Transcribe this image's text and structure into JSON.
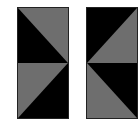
{
  "figure": {
    "panels": [
      {
        "name": "left-panel",
        "x": 17,
        "y": 7,
        "w": 52,
        "h": 112,
        "top_half": {
          "dark_triangle": "lower-left",
          "light_triangle": "upper-right"
        },
        "bottom_half": {
          "dark_triangle": "lower-right",
          "light_triangle": "upper-left"
        }
      },
      {
        "name": "right-panel",
        "x": 86,
        "y": 7,
        "w": 52,
        "h": 112,
        "top_half": {
          "dark_triangle": "upper-left",
          "light_triangle": "lower-right"
        },
        "bottom_half": {
          "dark_triangle": "upper-right",
          "light_triangle": "lower-left"
        }
      }
    ],
    "colors": {
      "dark": "#000000",
      "gray": "#6e6e6e",
      "background": "#ffffff"
    }
  }
}
